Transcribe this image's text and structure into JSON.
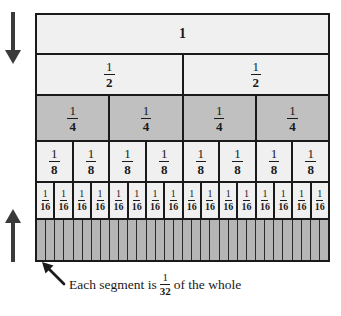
{
  "colors": {
    "border": "#1a1a1a",
    "fill_light": "#f0f0f0",
    "fill_gray": "#c0c0c0",
    "stripe_gray": "#b5b5b5",
    "arrow": "#3a3a3a",
    "text": "#1a1a1a",
    "background": "#ffffff"
  },
  "rows": [
    {
      "id": "whole",
      "denominator": 1,
      "count": 1,
      "fill": "light",
      "labeled": true,
      "label_kind": "integer",
      "numerator": "1",
      "cells": [
        "1"
      ]
    },
    {
      "id": "halves",
      "denominator": 2,
      "count": 2,
      "fill": "light",
      "labeled": true,
      "label_kind": "fraction",
      "numerator": "1",
      "denominator_text": "2",
      "cells": [
        "1/2",
        "1/2"
      ]
    },
    {
      "id": "fourths",
      "denominator": 4,
      "count": 4,
      "fill": "gray",
      "labeled": true,
      "label_kind": "fraction",
      "numerator": "1",
      "denominator_text": "4",
      "cells": [
        "1/4",
        "1/4",
        "1/4",
        "1/4"
      ]
    },
    {
      "id": "eighths",
      "denominator": 8,
      "count": 8,
      "fill": "light",
      "labeled": true,
      "label_kind": "fraction",
      "numerator": "1",
      "denominator_text": "8",
      "cells": [
        "1/8",
        "1/8",
        "1/8",
        "1/8",
        "1/8",
        "1/8",
        "1/8",
        "1/8"
      ]
    },
    {
      "id": "sixteenths",
      "denominator": 16,
      "count": 16,
      "fill": "light",
      "labeled": true,
      "label_kind": "fraction",
      "numerator": "1",
      "denominator_text": "16",
      "cells": [
        "1/16",
        "1/16",
        "1/16",
        "1/16",
        "1/16",
        "1/16",
        "1/16",
        "1/16",
        "1/16",
        "1/16",
        "1/16",
        "1/16",
        "1/16",
        "1/16",
        "1/16",
        "1/16"
      ]
    },
    {
      "id": "thirtyseconds",
      "denominator": 32,
      "count": 32,
      "fill": "stripe",
      "labeled": false,
      "label_kind": "none",
      "numerator": "1",
      "denominator_text": "32",
      "cells": []
    }
  ],
  "annotations": {
    "arrow_down": {
      "name": "arrow-down",
      "direction": "down"
    },
    "arrow_up": {
      "name": "arrow-up",
      "direction": "up"
    },
    "pointer": {
      "name": "pointer-arrow",
      "direction": "up-left"
    },
    "caption": {
      "prefix": "Each segment is",
      "fraction_numerator": "1",
      "fraction_denominator": "32",
      "suffix": "of the whole",
      "full_text": "Each segment is 1/32 of the whole"
    }
  }
}
